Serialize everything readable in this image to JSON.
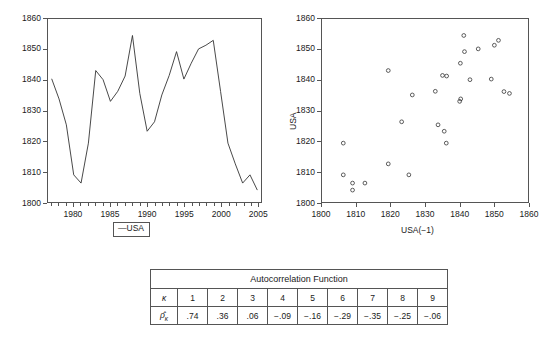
{
  "chart_data": [
    {
      "type": "line",
      "title": "",
      "xlabel": "",
      "ylabel": "",
      "xlim": [
        1976.5,
        2005.5
      ],
      "ylim": [
        1800,
        1860
      ],
      "xticks": [
        1980,
        1985,
        1990,
        1995,
        2000,
        2005
      ],
      "yticks": [
        1800,
        1810,
        1820,
        1830,
        1840,
        1850,
        1860
      ],
      "grid": false,
      "legend": [
        "USA"
      ],
      "legend_position": "below",
      "legend_marker": "—",
      "series": [
        {
          "name": "USA",
          "x": [
            1977,
            1978,
            1979,
            1980,
            1981,
            1982,
            1983,
            1984,
            1985,
            1986,
            1987,
            1988,
            1989,
            1990,
            1991,
            1992,
            1993,
            1994,
            1995,
            1996,
            1997,
            1998,
            1999,
            2000,
            2001,
            2002,
            2003,
            2004,
            2005
          ],
          "values": [
            1840.4,
            1833.8,
            1825.3,
            1808.9,
            1806.2,
            1819.3,
            1843.1,
            1840.1,
            1833.0,
            1836.3,
            1841.3,
            1854.6,
            1835.6,
            1823.2,
            1826.3,
            1835.1,
            1841.5,
            1849.3,
            1840.3,
            1845.5,
            1850.2,
            1851.4,
            1853.0,
            1836.2,
            1819.3,
            1812.5,
            1806.2,
            1808.9,
            1803.9
          ]
        }
      ]
    },
    {
      "type": "scatter",
      "title": "",
      "xlabel": "USA(−1)",
      "ylabel": "USA",
      "xlim": [
        1800,
        1860
      ],
      "ylim": [
        1800,
        1860
      ],
      "xticks": [
        1800,
        1810,
        1820,
        1830,
        1840,
        1850,
        1860
      ],
      "yticks": [
        1800,
        1810,
        1820,
        1830,
        1840,
        1850,
        1860
      ],
      "grid": false,
      "marker": "open-circle",
      "points": [
        [
          1840.4,
          1833.8
        ],
        [
          1833.8,
          1825.3
        ],
        [
          1825.3,
          1808.9
        ],
        [
          1808.9,
          1806.2
        ],
        [
          1806.2,
          1819.3
        ],
        [
          1819.3,
          1843.1
        ],
        [
          1843.1,
          1840.1
        ],
        [
          1840.1,
          1833.0
        ],
        [
          1833.0,
          1836.3
        ],
        [
          1836.3,
          1841.3
        ],
        [
          1841.3,
          1854.6
        ],
        [
          1854.6,
          1835.6
        ],
        [
          1835.6,
          1823.2
        ],
        [
          1823.2,
          1826.3
        ],
        [
          1826.3,
          1835.1
        ],
        [
          1835.1,
          1841.5
        ],
        [
          1841.5,
          1849.3
        ],
        [
          1849.3,
          1840.3
        ],
        [
          1840.3,
          1845.5
        ],
        [
          1845.5,
          1850.2
        ],
        [
          1850.2,
          1851.4
        ],
        [
          1851.4,
          1853.0
        ],
        [
          1853.0,
          1836.2
        ],
        [
          1836.2,
          1819.3
        ],
        [
          1819.3,
          1812.5
        ],
        [
          1812.5,
          1806.2
        ],
        [
          1806.2,
          1808.9
        ],
        [
          1808.9,
          1803.9
        ]
      ]
    }
  ],
  "line_chart": {
    "yticks": [
      "1860",
      "1850",
      "1840",
      "1830",
      "1820",
      "1810",
      "1800"
    ],
    "xticks": [
      "1980",
      "1985",
      "1990",
      "1995",
      "2000",
      "2005"
    ]
  },
  "legend": {
    "marker": "—",
    "label": "USA"
  },
  "scatter_chart": {
    "yticks": [
      "1860",
      "1850",
      "1840",
      "1830",
      "1820",
      "1810",
      "1800"
    ],
    "xticks": [
      "1800",
      "1810",
      "1820",
      "1830",
      "1840",
      "1850",
      "1860"
    ],
    "ylabel": "USA",
    "xlabel": "USA(−1)"
  },
  "acf_table": {
    "title": "Autocorrelation Function",
    "row_labels": [
      "κ",
      "ρ̂"
    ],
    "row_label_sub": "κ",
    "lags": [
      "1",
      "2",
      "3",
      "4",
      "5",
      "6",
      "7",
      "8",
      "9"
    ],
    "values": [
      ".74",
      ".36",
      ".06",
      "−.09",
      "−.16",
      "−.29",
      "−.35",
      "−.25",
      "−.06"
    ]
  }
}
